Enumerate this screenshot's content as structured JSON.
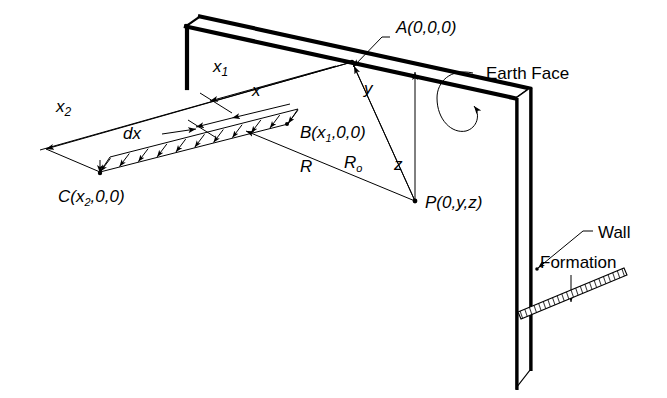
{
  "figure": {
    "domain": "diagram",
    "title_text": "",
    "background_color": "#ffffff",
    "line_color": "#000000"
  },
  "labels": {
    "point_a": "A(0,0,0)",
    "point_b_main": "B(x",
    "point_b_sub": "1",
    "point_b_tail": ",0,0)",
    "point_c_main": "C(x",
    "point_c_sub": "2",
    "point_c_tail": ",0,0)",
    "point_p": "P(0,y,z)",
    "dim_x1_main": "x",
    "dim_x1_sub": "1",
    "dim_x2_main": "x",
    "dim_x2_sub": "2",
    "dim_x": "x",
    "dim_dx": "dx",
    "vector_r": "R",
    "vector_ro_main": "R",
    "vector_ro_sub": "o",
    "axis_y": "y",
    "axis_z": "z",
    "callout_earth_face": "Earth Face",
    "callout_wall": "Wall",
    "callout_formation": "Formation"
  },
  "icons": {
    "load_arrow": "down-arrow-icon",
    "dimension_arrow": "dimension-arrow-icon",
    "leader_line": "leader-line-icon",
    "hatch_band": "hatched-formation-icon"
  },
  "geometry": {
    "wall_top_front_left": [
      186,
      26
    ],
    "wall_top_front_right": [
      516,
      98
    ],
    "wall_top_back_left": [
      200,
      16
    ],
    "wall_top_back_right": [
      530,
      88
    ],
    "wall_bottom_front": [
      516,
      388
    ],
    "wall_bottom_back": [
      530,
      370
    ],
    "wall_left_end_bottom": [
      186,
      88
    ],
    "origin_a": [
      352,
      62
    ],
    "point_p": [
      415,
      201
    ],
    "point_b": [
      283,
      117
    ],
    "point_c": [
      100,
      172
    ],
    "strip_near_left": [
      102,
      165
    ],
    "strip_near_right": [
      286,
      124
    ],
    "formation_start": [
      519,
      307
    ],
    "formation_end": [
      625,
      271
    ]
  },
  "load_strip": {
    "arrow_count": 11,
    "arrow_direction": "down"
  }
}
